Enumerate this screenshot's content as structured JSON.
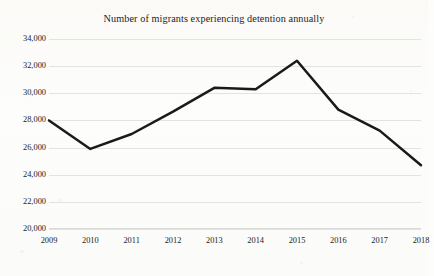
{
  "chart_data": {
    "type": "line",
    "title": "Number of migrants experiencing detention annually",
    "xlabel": "",
    "ylabel": "",
    "categories": [
      "2009",
      "2010",
      "2011",
      "2012",
      "2013",
      "2014",
      "2015",
      "2016",
      "2017",
      "2018"
    ],
    "values": [
      28000,
      25900,
      27000,
      28650,
      30400,
      30300,
      32400,
      28800,
      27250,
      24700
    ],
    "series": [
      {
        "name": "Migrants experiencing detention",
        "values": [
          28000,
          25900,
          27000,
          28650,
          30400,
          30300,
          32400,
          28800,
          27250,
          24700
        ]
      }
    ],
    "ylim": [
      20000,
      34000
    ],
    "ytick_values": [
      20000,
      22000,
      24000,
      26000,
      28000,
      30000,
      32000,
      34000
    ],
    "ytick_labels": [
      "20,000",
      "22,000",
      "24,000",
      "26,000",
      "28,000",
      "30,000",
      "32,000",
      "34,000"
    ],
    "grid": true,
    "legend": false,
    "line_color": "#1a1a1a",
    "grid_color": "#e3e3e1",
    "background_color": "#fdfdfb"
  }
}
